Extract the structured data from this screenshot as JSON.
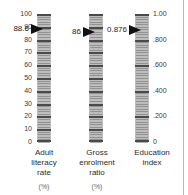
{
  "figure": {
    "background": "#ffffff",
    "bar_color": "#bdbdbd",
    "tick_color": "#5e5e5e",
    "arrow_color": "#111111",
    "rule_color": "#b9b9b9"
  },
  "scales": [
    {
      "id": "adult-literacy-rate",
      "caption_lines": [
        "Adult",
        "literacy",
        "rate"
      ],
      "unit": "(%)",
      "label_side": "left",
      "axis_min": 0,
      "axis_max": 100,
      "tick_labels": [
        "100",
        "90",
        "80",
        "70",
        "60",
        "50",
        "40",
        "30",
        "20",
        "10",
        "0"
      ],
      "tick_values": [
        100,
        90,
        80,
        70,
        60,
        50,
        40,
        30,
        20,
        10,
        0
      ],
      "minor_step": 2,
      "value": 88.6,
      "value_label": "88.6"
    },
    {
      "id": "gross-enrolment-ratio",
      "caption_lines": [
        "Gross",
        "enrolment",
        "ratio"
      ],
      "unit": "(%)",
      "label_side": "none",
      "axis_min": 0,
      "axis_max": 100,
      "tick_labels": [],
      "tick_values": [
        100,
        90,
        80,
        70,
        60,
        50,
        40,
        30,
        20,
        10,
        0
      ],
      "minor_step": 2,
      "value": 86,
      "value_label": "86"
    },
    {
      "id": "education-index",
      "caption_lines": [
        "Education",
        "index"
      ],
      "unit": "",
      "label_side": "right",
      "axis_min": 0,
      "axis_max": 1,
      "tick_labels": [
        "1.00",
        ".800",
        ".600",
        ".400",
        ".200",
        "0"
      ],
      "tick_values": [
        1.0,
        0.8,
        0.6,
        0.4,
        0.2,
        0.0
      ],
      "minor_step": 0.02,
      "value": 0.876,
      "value_label": "0.876"
    }
  ],
  "chart_data": {
    "type": "bar",
    "title": "",
    "xlabel": "",
    "ylabel": "",
    "categories": [
      "Adult literacy rate (%)",
      "Gross enrolment ratio (%)",
      "Education index"
    ],
    "values": [
      88.6,
      86,
      0.876
    ],
    "axis_ranges": [
      [
        0,
        100
      ],
      [
        0,
        100
      ],
      [
        0,
        1
      ]
    ],
    "tick_labels": [
      [
        "100",
        "90",
        "80",
        "70",
        "60",
        "50",
        "40",
        "30",
        "20",
        "10",
        "0"
      ],
      [],
      [
        "1.00",
        ".800",
        ".600",
        ".400",
        ".200",
        "0"
      ]
    ],
    "grid": false,
    "legend": "none",
    "annotations": [
      "88.6",
      "86",
      "0.876"
    ]
  }
}
